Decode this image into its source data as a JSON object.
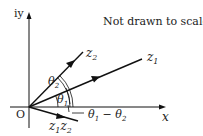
{
  "diagram": {
    "note": "Not drawn to scale",
    "axes": {
      "x_label": "x",
      "y_label": "iy",
      "origin_label": "O"
    },
    "vectors": [
      {
        "name": "z1",
        "label": "z",
        "sub": "1"
      },
      {
        "name": "z2",
        "label": "z",
        "sub": "2"
      },
      {
        "name": "z1z2",
        "label": "z",
        "sub": "1",
        "label2": "z",
        "sub2": "2"
      }
    ],
    "angles": {
      "theta1": {
        "sym": "θ",
        "sub": "1"
      },
      "theta2": {
        "sym": "θ",
        "sub": "2"
      },
      "diff": {
        "sym1": "θ",
        "sub1": "1",
        "op": " − ",
        "sym2": "θ",
        "sub2": "2"
      }
    },
    "colors": {
      "line": "#111111",
      "text": "#222222"
    }
  }
}
